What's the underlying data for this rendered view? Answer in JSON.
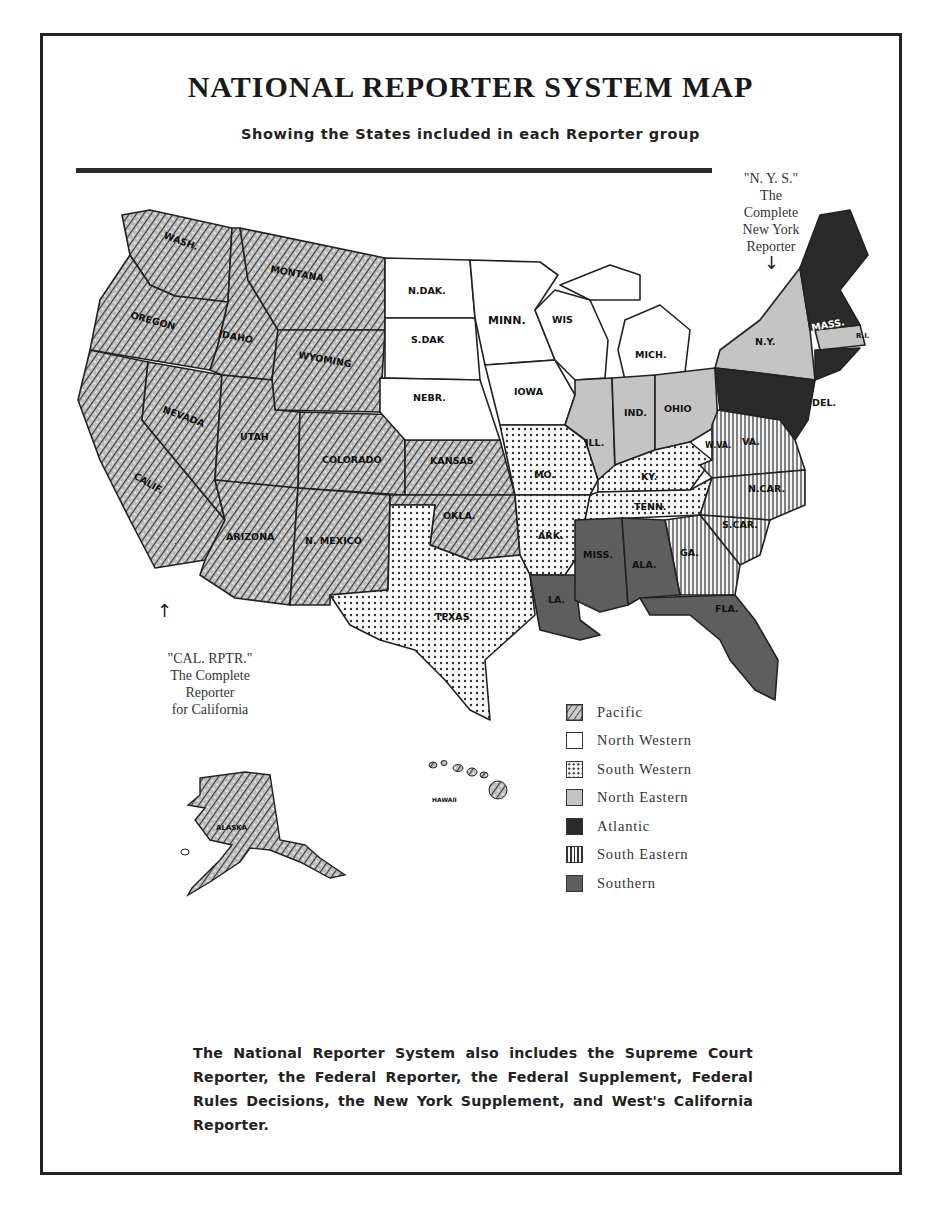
{
  "header": {
    "title": "NATIONAL REPORTER SYSTEM MAP",
    "subtitle": "Showing the States included in each Reporter group"
  },
  "callouts": {
    "ny": {
      "abbrev": "\"N. Y. S.\"",
      "line1": "The",
      "line2": "Complete",
      "line3": "New York",
      "line4": "Reporter",
      "arrow": "↓"
    },
    "cal": {
      "abbrev": "\"CAL. RPTR.\"",
      "line1": "The Complete",
      "line2": "Reporter",
      "line3": "for California",
      "arrow": "↑"
    }
  },
  "colors": {
    "pacific": "#9a9a9a",
    "north_western": "#ffffff",
    "south_western": "#f4f4f4",
    "north_eastern": "#c4c4c4",
    "atlantic": "#2a2a2a",
    "south_eastern": "#e8e8e8",
    "southern": "#5e5e5e",
    "border": "#222222"
  },
  "legend": [
    {
      "key": "pacific",
      "label": "Pacific",
      "pattern": "pacific-texture"
    },
    {
      "key": "north_western",
      "label": "North Western",
      "pattern": "blank"
    },
    {
      "key": "south_western",
      "label": "South Western",
      "pattern": "dots"
    },
    {
      "key": "north_eastern",
      "label": "North Eastern",
      "pattern": "light-gray"
    },
    {
      "key": "atlantic",
      "label": "Atlantic",
      "pattern": "solid-dark"
    },
    {
      "key": "south_eastern",
      "label": "South Eastern",
      "pattern": "vertical-lines"
    },
    {
      "key": "southern",
      "label": "Southern",
      "pattern": "medium-gray"
    }
  ],
  "states": {
    "wash": "WASH.",
    "oregon": "OREGON",
    "calif": "CALIF.",
    "idaho": "IDAHO",
    "nevada": "NEVADA",
    "montana": "MONTANA",
    "wyoming": "WYOMING",
    "utah": "UTAH",
    "colorado": "COLORADO",
    "arizona": "ARIZONA",
    "nmexico": "N. MEXICO",
    "kansas": "KANSAS",
    "okla": "OKLA.",
    "ndak": "N.DAK.",
    "sdak": "S.DAK",
    "nebr": "NEBR.",
    "minn": "MINN.",
    "iowa": "IOWA",
    "wis": "WIS",
    "mich": "MICH.",
    "ill": "ILL.",
    "ind": "IND.",
    "ohio": "OHIO",
    "ny": "N.Y.",
    "mass": "MASS.",
    "ri": "R.I.",
    "del": "DEL.",
    "mo": "MO.",
    "ark": "ARK.",
    "texas": "TEXAS",
    "ky": "KY.",
    "tenn": "TENN.",
    "wva": "W.VA.",
    "va": "VA.",
    "ncar": "N.CAR.",
    "scar": "S.CAR.",
    "ga": "GA.",
    "la": "LA.",
    "miss": "MISS.",
    "ala": "ALA.",
    "fla": "FLA.",
    "alaska": "ALASKA",
    "hawaii": "HAWAII"
  },
  "footer": {
    "text": "The National Reporter System also includes the Supreme Court Reporter, the Federal Reporter, the Federal Supplement, Federal Rules Decisions, the New York Supplement, and West's California Reporter."
  }
}
